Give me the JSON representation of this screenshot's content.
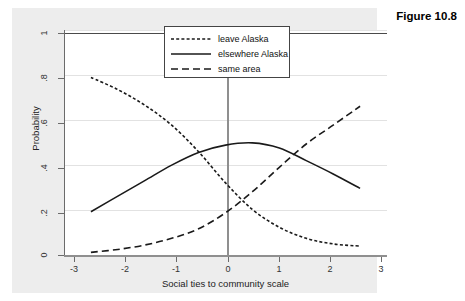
{
  "figure": {
    "caption": "Figure 10.8"
  },
  "chart_data": {
    "type": "line",
    "title": "",
    "xlabel": "Social ties to community scale",
    "ylabel": "Probability",
    "xlim": [
      -3,
      3
    ],
    "ylim": [
      0,
      1
    ],
    "xticks": [
      "-3",
      "-2",
      "-1",
      "0",
      "1",
      "2",
      "3"
    ],
    "xtick_values": [
      -3,
      -2,
      -1,
      0,
      1,
      2,
      3
    ],
    "yticks": [
      "0",
      ".2",
      ".4",
      ".6",
      ".8",
      "1"
    ],
    "ytick_values": [
      0,
      0.2,
      0.4,
      0.6,
      0.8,
      1
    ],
    "grid": true,
    "grid_axis": "y",
    "legend_position": "top-center",
    "reference_line_x": 0,
    "x": [
      -2.5,
      -2.0,
      -1.5,
      -1.0,
      -0.5,
      0.0,
      0.5,
      1.0,
      1.5,
      2.0,
      2.5
    ],
    "series": [
      {
        "name": "leave Alaska",
        "style": "dotted",
        "values": [
          0.8,
          0.745,
          0.675,
          0.585,
          0.465,
          0.325,
          0.205,
          0.125,
          0.075,
          0.05,
          0.04
        ]
      },
      {
        "name": "elsewhere Alaska",
        "style": "solid",
        "values": [
          0.195,
          0.265,
          0.335,
          0.405,
          0.462,
          0.495,
          0.505,
          0.482,
          0.425,
          0.365,
          0.3
        ]
      },
      {
        "name": "same area",
        "style": "dashed",
        "values": [
          0.012,
          0.025,
          0.045,
          0.075,
          0.118,
          0.19,
          0.285,
          0.395,
          0.5,
          0.585,
          0.67
        ]
      }
    ]
  },
  "legend": {
    "items": [
      {
        "label": "leave Alaska",
        "style": "dotted"
      },
      {
        "label": "elsewhere Alaska",
        "style": "solid"
      },
      {
        "label": "same area",
        "style": "dashed"
      }
    ]
  }
}
